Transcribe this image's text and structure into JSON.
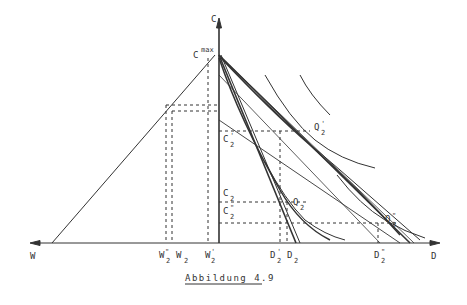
{
  "figure": {
    "caption": "Abbildung 4.9",
    "axes": {
      "vertical_label": "C",
      "left_label": "W",
      "right_label": "D",
      "cmax_base": "C",
      "cmax_sup": "max"
    },
    "points": [
      {
        "name": "Q",
        "sub": "2",
        "prime": "'"
      },
      {
        "name": "Q",
        "sub": "2",
        "prime": ""
      },
      {
        "name": "Q",
        "sub": "2",
        "prime": "\""
      }
    ],
    "c_labels": [
      {
        "name": "C",
        "sub": "2",
        "prime": "'"
      },
      {
        "name": "C",
        "sub": "2",
        "prime": ""
      },
      {
        "name": "C",
        "sub": "2",
        "prime": "\""
      }
    ],
    "w_ticks": [
      {
        "name": "W",
        "sub": "2",
        "prime": "\""
      },
      {
        "name": "W",
        "sub": "2",
        "prime": ""
      },
      {
        "name": "W",
        "sub": "2",
        "prime": "'"
      }
    ],
    "d_ticks": [
      {
        "name": "D",
        "sub": "2",
        "prime": "'"
      },
      {
        "name": "D",
        "sub": "2",
        "prime": ""
      },
      {
        "name": "D",
        "sub": "2",
        "prime": "\""
      }
    ]
  }
}
